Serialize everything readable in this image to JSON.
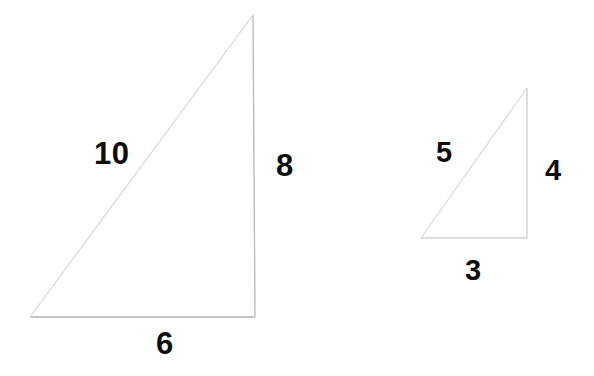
{
  "figure": {
    "background_color": "#ffffff",
    "stroke_color": "#b3b3b3",
    "hypotenuse_color": "#cfcfcf",
    "label_color": "#0d0d0d",
    "triangles": [
      {
        "name": "large-triangle",
        "vertices": {
          "bottom_left": [
            30,
            317
          ],
          "bottom_right": [
            255,
            317
          ],
          "apex": [
            253,
            15
          ]
        },
        "sides": {
          "hypotenuse": "10",
          "vertical": "8",
          "base": "6"
        }
      },
      {
        "name": "small-triangle",
        "vertices": {
          "bottom_left": [
            421,
            238
          ],
          "bottom_right": [
            527,
            238
          ],
          "apex": [
            527,
            88
          ]
        },
        "sides": {
          "hypotenuse": "5",
          "vertical": "4",
          "base": "3"
        }
      }
    ]
  },
  "labels": {
    "large_hypotenuse": "10",
    "large_vertical": "8",
    "large_base": "6",
    "small_hypotenuse": "5",
    "small_vertical": "4",
    "small_base": "3"
  }
}
